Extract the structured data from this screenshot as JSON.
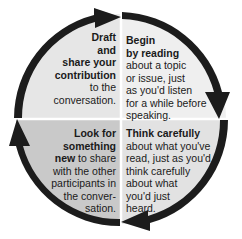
{
  "diagram": {
    "type": "cycle",
    "quadrants": [
      {
        "position": "top-right",
        "step": 1,
        "bold": "Begin by reading",
        "bold_lines": [
          "Begin",
          "by reading"
        ],
        "rest_lines": [
          "about a topic",
          "or issue, just",
          "as you'd listen",
          "for a while before",
          "speaking."
        ],
        "fill": "#efefef"
      },
      {
        "position": "bottom-right",
        "step": 2,
        "bold": "Think carefully",
        "bold_lines": [
          "Think carefully"
        ],
        "rest_lines": [
          "about what you've",
          "read, just as you'd",
          "think carefully",
          "about what",
          "you'd just",
          "heard."
        ],
        "fill": "#e2e2e2"
      },
      {
        "position": "bottom-left",
        "step": 3,
        "bold": "Look for something new",
        "bold_lines": [
          "Look for",
          "something"
        ],
        "mixed_line": {
          "bold": "new",
          "rest": " to share"
        },
        "rest_lines": [
          "with the other",
          "participants in",
          "the conver-",
          "sation."
        ],
        "fill": "#c9c9c9"
      },
      {
        "position": "top-left",
        "step": 4,
        "bold": "Draft and share your contribution",
        "bold_lines": [
          "Draft",
          "and",
          "share your",
          "contribution"
        ],
        "rest_lines": [
          "to the",
          "conversation."
        ],
        "fill": "#e6e6e6"
      }
    ],
    "arrow_color": "#1c1c1c",
    "divider_color": "#ffffff",
    "direction": "clockwise"
  }
}
